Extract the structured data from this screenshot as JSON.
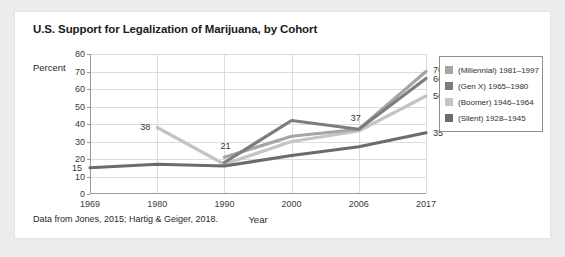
{
  "card": {
    "title": "U.S. Support for Legalization of Marijuana, by Cohort",
    "footnote": "Data from Jones, 2015; Hartig & Geiger, 2018."
  },
  "colors": {
    "millennial": "#a5a5a5",
    "genx": "#7d7d7d",
    "boomer": "#c4c4c4",
    "silent": "#6b6b6b",
    "axis": "#9a9a9a",
    "grid": "#dcdcdc",
    "card_background": "#ffffff",
    "page_background": "#ececec",
    "title_text": "#1b1b1b"
  },
  "chart_data": {
    "type": "line",
    "title": "U.S. Support for Legalization of Marijuana, by Cohort",
    "xlabel": "Year",
    "ylabel": "Percent",
    "categories": [
      "1969",
      "1980",
      "1990",
      "2000",
      "2006",
      "2017"
    ],
    "ylim": [
      0,
      80
    ],
    "yticks": [
      "0",
      "10",
      "20",
      "30",
      "40",
      "50",
      "60",
      "70",
      "80"
    ],
    "grid": true,
    "legend_position": "right",
    "series": [
      {
        "name": "(Millennial) 1981–1997",
        "color": "#a5a5a5",
        "values": [
          null,
          null,
          21,
          33,
          37,
          70
        ]
      },
      {
        "name": "(Gen X) 1965–1980",
        "color": "#7d7d7d",
        "values": [
          null,
          null,
          18,
          42,
          37,
          66
        ]
      },
      {
        "name": "(Boomer) 1946–1964",
        "color": "#c4c4c4",
        "values": [
          null,
          38,
          17,
          30,
          36,
          56
        ]
      },
      {
        "name": "(Silent) 1928–1945",
        "color": "#6b6b6b",
        "values": [
          15,
          17,
          16,
          22,
          27,
          35
        ]
      }
    ],
    "point_labels": [
      {
        "text": "15",
        "category": "1969",
        "value": 15,
        "dx": -13,
        "dy": 0
      },
      {
        "text": "38",
        "category": "1980",
        "value": 38,
        "dx": -12,
        "dy": -1
      },
      {
        "text": "21",
        "category": "1990",
        "value": 21,
        "dx": 1,
        "dy": -11
      },
      {
        "text": "37",
        "category": "2006",
        "value": 37,
        "dx": -3,
        "dy": -11
      },
      {
        "text": "70",
        "category": "2017",
        "value": 70,
        "dx": 12,
        "dy": -2
      },
      {
        "text": "66",
        "category": "2017",
        "value": 66,
        "dx": 12,
        "dy": 0
      },
      {
        "text": "56",
        "category": "2017",
        "value": 56,
        "dx": 12,
        "dy": 0
      },
      {
        "text": "35",
        "category": "2017",
        "value": 35,
        "dx": 12,
        "dy": 0
      }
    ]
  }
}
